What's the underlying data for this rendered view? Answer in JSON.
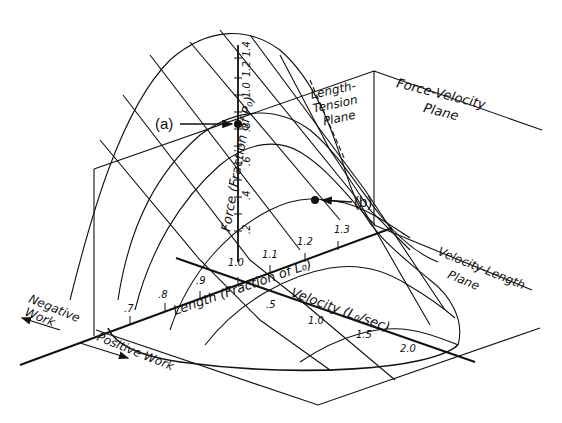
{
  "diagram": {
    "planes": {
      "length_tension": "Length-Tension Plane",
      "force_velocity": "Force-Velocity Plane",
      "velocity_length": "Velocity-Length Plane"
    },
    "axes": {
      "force": {
        "label": "Force (Fraction of P₀)",
        "ticks": [
          ".2",
          ".4",
          ".6",
          ".8",
          "1.0",
          "1.2",
          "1.4"
        ]
      },
      "length": {
        "label": "Length (Fraction of L₀)",
        "ticks": [
          ".7",
          ".8",
          ".9",
          "1.0",
          "1.1",
          "1.2",
          "1.3"
        ]
      },
      "velocity": {
        "label": "Velocity (L₀/sec)",
        "ticks": [
          ".5",
          "1.0",
          "1.5",
          "2.0"
        ]
      }
    },
    "points": [
      {
        "id": "a",
        "label": "(a)"
      },
      {
        "id": "b",
        "label": "(b)"
      }
    ],
    "work": {
      "negative": [
        "Negative",
        "Work"
      ],
      "positive": "Positive Work"
    }
  }
}
